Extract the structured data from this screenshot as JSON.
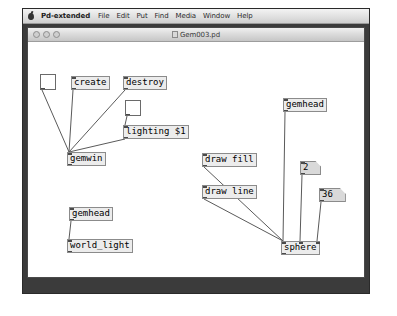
{
  "app": {
    "menubar": {
      "apple_icon": "apple-logo-icon",
      "app_name": "Pd-extended",
      "items": [
        {
          "label": "File"
        },
        {
          "label": "Edit"
        },
        {
          "label": "Put"
        },
        {
          "label": "Find"
        },
        {
          "label": "Media"
        },
        {
          "label": "Window"
        },
        {
          "label": "Help"
        }
      ]
    }
  },
  "patch_window": {
    "title": "Gem003.pd",
    "traffic_lights": [
      "close-button",
      "minimize-button",
      "zoom-button"
    ]
  },
  "canvas": {
    "nodes": [
      {
        "id": "toggle-create",
        "kind": "toggle",
        "label": "",
        "x": 12,
        "y": 32,
        "inlets": 0,
        "outlets": 1
      },
      {
        "id": "msg-create",
        "kind": "msg",
        "label": "create",
        "x": 43,
        "y": 34,
        "inlets": 1,
        "outlets": 1
      },
      {
        "id": "msg-destroy",
        "kind": "msg",
        "label": "destroy",
        "x": 95,
        "y": 34,
        "inlets": 1,
        "outlets": 1
      },
      {
        "id": "toggle-lighting",
        "kind": "toggle",
        "label": "",
        "x": 97,
        "y": 58,
        "inlets": 0,
        "outlets": 1
      },
      {
        "id": "msg-lighting",
        "kind": "msg",
        "label": "lighting $1",
        "x": 95,
        "y": 83,
        "inlets": 1,
        "outlets": 1
      },
      {
        "id": "obj-gemwin",
        "kind": "obj",
        "label": "gemwin",
        "x": 39,
        "y": 110,
        "inlets": 1,
        "outlets": 1
      },
      {
        "id": "obj-gemhead-l",
        "kind": "obj",
        "label": "gemhead",
        "x": 41,
        "y": 165,
        "inlets": 1,
        "outlets": 1
      },
      {
        "id": "obj-worldlight",
        "kind": "obj",
        "label": "world_light",
        "x": 39,
        "y": 197,
        "inlets": 1,
        "outlets": 1
      },
      {
        "id": "msg-drawfill",
        "kind": "msg",
        "label": "draw fill",
        "x": 174,
        "y": 111,
        "inlets": 1,
        "outlets": 1
      },
      {
        "id": "msg-drawline",
        "kind": "msg",
        "label": "draw line",
        "x": 174,
        "y": 143,
        "inlets": 1,
        "outlets": 1
      },
      {
        "id": "obj-gemhead-r",
        "kind": "obj",
        "label": "gemhead",
        "x": 255,
        "y": 56,
        "inlets": 1,
        "outlets": 1
      },
      {
        "id": "num-2",
        "kind": "numbox",
        "label": "2",
        "x": 272,
        "y": 119,
        "inlets": 1,
        "outlets": 1
      },
      {
        "id": "num-36",
        "kind": "numbox",
        "label": "36",
        "x": 291,
        "y": 146,
        "inlets": 1,
        "outlets": 1
      },
      {
        "id": "obj-sphere",
        "kind": "obj",
        "label": "sphere",
        "x": 253,
        "y": 199,
        "inlets": 3,
        "outlets": 1
      }
    ],
    "connections": [
      {
        "from": "toggle-create",
        "to": "obj-gemwin",
        "to_inlet": 0
      },
      {
        "from": "msg-create",
        "to": "obj-gemwin",
        "to_inlet": 0
      },
      {
        "from": "msg-destroy",
        "to": "obj-gemwin",
        "to_inlet": 0
      },
      {
        "from": "msg-lighting",
        "to": "obj-gemwin",
        "to_inlet": 0
      },
      {
        "from": "toggle-lighting",
        "to": "msg-lighting",
        "to_inlet": 0
      },
      {
        "from": "obj-gemhead-l",
        "to": "obj-worldlight",
        "to_inlet": 0
      },
      {
        "from": "msg-drawfill",
        "to": "obj-sphere",
        "to_inlet": 0
      },
      {
        "from": "msg-drawline",
        "to": "obj-sphere",
        "to_inlet": 0
      },
      {
        "from": "obj-gemhead-r",
        "to": "obj-sphere",
        "to_inlet": 0
      },
      {
        "from": "num-2",
        "to": "obj-sphere",
        "to_inlet": 1
      },
      {
        "from": "num-36",
        "to": "obj-sphere",
        "to_inlet": 2
      }
    ]
  },
  "colors": {
    "window_frame": "#3b3b3b",
    "canvas_bg": "#ffffff",
    "object_fill": "#ececec",
    "numbox_fill": "#d9d9d9",
    "object_border": "#8b8b8b",
    "wire": "#5a5a5a"
  }
}
